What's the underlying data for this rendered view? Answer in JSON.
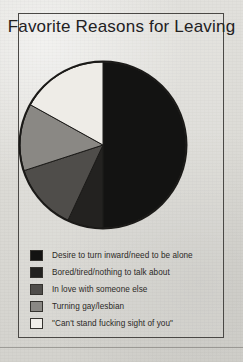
{
  "page": {
    "title": "Favorite Reasons for Leaving",
    "frame_border_color": "#4a4845",
    "background_color": "#dcdbd6"
  },
  "chart_data": {
    "type": "pie",
    "title": "Favorite Reasons for Leaving",
    "xlabel": "",
    "ylabel": "",
    "legend_position": "bottom-left",
    "grid": false,
    "categories": [
      "Desire to turn inward/need to be alone",
      "Bored/tired/nothing to talk about",
      "In love with someone else",
      "Turning gay/lesbian",
      "\"Can't stand fucking sight of you\""
    ],
    "values": [
      50,
      7,
      13,
      13,
      17
    ],
    "colors": [
      "#131312",
      "#232220",
      "#4f4d4a",
      "#8a8884",
      "#eeece7"
    ],
    "slices": [
      {
        "label": "Desire to turn inward/need to be alone",
        "value": 50,
        "color": "#131312",
        "start_angle": 0,
        "end_angle": 180
      },
      {
        "label": "Bored/tired/nothing to talk about",
        "value": 7,
        "color": "#232220",
        "start_angle": 180,
        "end_angle": 205
      },
      {
        "label": "In love with someone else",
        "value": 13,
        "color": "#4f4d4a",
        "start_angle": 205,
        "end_angle": 252
      },
      {
        "label": "Turning gay/lesbian",
        "value": 13,
        "color": "#8a8884",
        "start_angle": 252,
        "end_angle": 299
      },
      {
        "label": "\"Can't stand fucking sight of you\"",
        "value": 17,
        "color": "#eeece7",
        "start_angle": 299,
        "end_angle": 360
      }
    ]
  },
  "legend": {
    "items": [
      {
        "label": "Desire to turn inward/need to be alone",
        "color": "#131312"
      },
      {
        "label": "Bored/tired/nothing to talk about",
        "color": "#232220"
      },
      {
        "label": "In love with someone else",
        "color": "#4f4d4a"
      },
      {
        "label": "Turning gay/lesbian",
        "color": "#8a8884"
      },
      {
        "label": "\"Can't stand fucking sight of you\"",
        "color": "#f1efea"
      }
    ]
  }
}
